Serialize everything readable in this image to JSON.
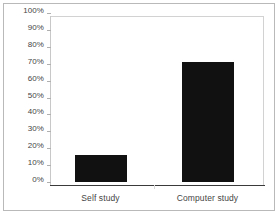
{
  "chart_data": {
    "type": "bar",
    "title": "",
    "subtitle": "",
    "xlabel": "",
    "ylabel": "",
    "categories": [
      "Self study",
      "Computer study"
    ],
    "values": [
      16,
      71
    ],
    "value_labels": [
      "16%",
      "71%"
    ],
    "ylim": [
      0,
      100
    ],
    "y_tick_values": [
      0,
      10,
      20,
      30,
      40,
      50,
      60,
      70,
      80,
      90,
      100
    ],
    "y_tick_labels": [
      "0%",
      "10%",
      "20%",
      "30%",
      "40%",
      "50%",
      "60%",
      "70%",
      "80%",
      "90%",
      "100%"
    ],
    "y_tick_suffix": "%",
    "grid": false,
    "legend": false,
    "legend_position": "none",
    "orientation": "vertical",
    "series": [
      {
        "name": "",
        "values": [
          16,
          71
        ],
        "color": "#111111"
      }
    ]
  },
  "style": {
    "bar_color": "#111111",
    "plot_background": "#ffffff",
    "frame_border_color": "#b9b9b9",
    "axis_line_color": "#3a3a3a",
    "plot_border_color": "#d2d2d2",
    "tick_mark_color": "#b0b0b0",
    "label_color": "#454545"
  }
}
